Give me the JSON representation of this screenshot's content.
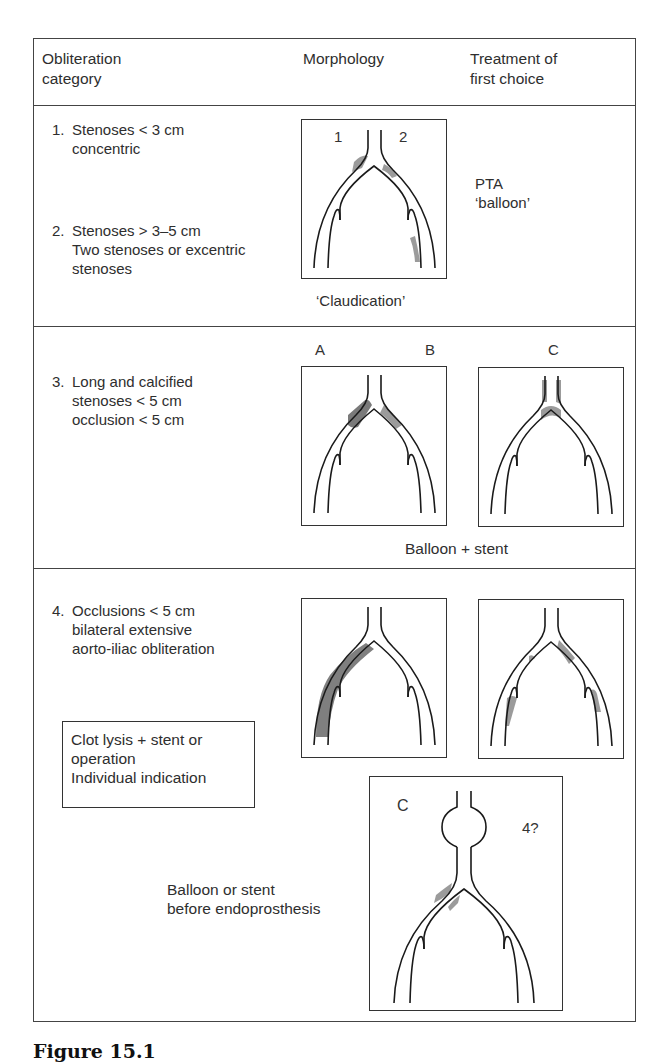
{
  "header": {
    "col1": "Obliteration\ncategory",
    "col2": "Morphology",
    "col3": "Treatment of\nfirst choice"
  },
  "rows": [
    {
      "items": [
        {
          "number": "1.",
          "text": "Stenoses < 3 cm\nconcentric"
        },
        {
          "number": "2.",
          "text": "Stenoses > 3–5 cm\nTwo stenoses or excentric\nstenoses"
        }
      ],
      "figure_labels": [
        "1",
        "2"
      ],
      "figure_caption": "‘Claudication’",
      "treatment": "PTA\n‘balloon’"
    },
    {
      "items": [
        {
          "number": "3.",
          "text": "Long and calcified\nstenoses < 5 cm\nocclusion < 5 cm"
        }
      ],
      "figure_labels": [
        "A",
        "B",
        "C"
      ],
      "treatment": "Balloon + stent"
    },
    {
      "items": [
        {
          "number": "4.",
          "text": "Occlusions < 5 cm\nbilateral extensive\naorto-iliac obliteration"
        }
      ],
      "treatment_box": "Clot lysis + stent or\noperation\nIndividual indication",
      "aneurysm_labels": [
        "C",
        "4?"
      ],
      "aneurysm_treatment": "Balloon or stent\nbefore endoprosthesis"
    }
  ],
  "caption": "Figure 15.1",
  "colors": {
    "line": "#1a1a1a",
    "border": "#444444",
    "shading": "#8a8a8a",
    "text": "#2e2e2e"
  }
}
